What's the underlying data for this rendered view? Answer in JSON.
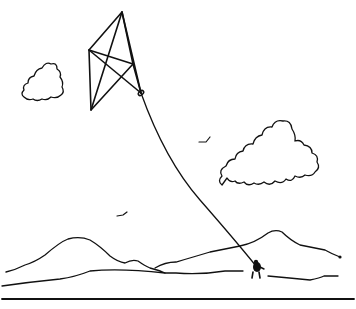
{
  "illustration": {
    "subject": "Line drawing of a person flying a kite",
    "stroke_color": "#111111",
    "background_color": "#ffffff",
    "elements": [
      {
        "name": "kite",
        "description": "diamond kite with cross struts"
      },
      {
        "name": "kite-string",
        "description": "string from kite to person"
      },
      {
        "name": "person",
        "description": "small figure holding string"
      },
      {
        "name": "cloud-small",
        "description": "small cloud at left"
      },
      {
        "name": "cloud-large",
        "description": "large cloud at right"
      },
      {
        "name": "bird",
        "count": 2
      },
      {
        "name": "mountains",
        "count": 2
      },
      {
        "name": "ground-lines",
        "count": 3
      }
    ]
  }
}
